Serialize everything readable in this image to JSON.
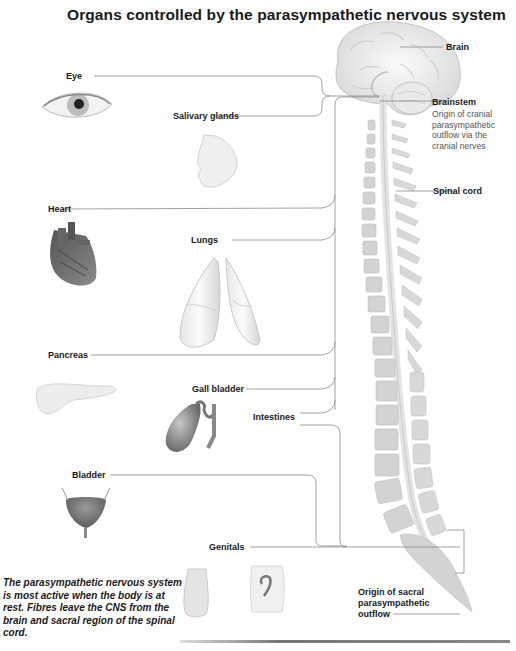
{
  "title": "Organs controlled by the parasympathetic nervous system",
  "labels": {
    "brain": "Brain",
    "brainstem": "Brainstem",
    "brainstem_desc": [
      "Origin of cranial",
      "parasympathetic",
      "outflow via the",
      "cranial nerves"
    ],
    "spinal_cord": "Spinal cord",
    "eye": "Eye",
    "salivary_glands": "Salivary glands",
    "heart": "Heart",
    "lungs": "Lungs",
    "pancreas": "Pancreas",
    "gall_bladder": "Gall bladder",
    "intestines": "Intestines",
    "bladder": "Bladder",
    "genitals": "Genitals",
    "sacral_origin": [
      "Origin of sacral",
      "parasympathetic",
      "outflow"
    ]
  },
  "note": "The parasympathetic nervous system is most active when the body is at rest. Fibres leave the CNS from the brain and sacral region of the spinal cord.",
  "colors": {
    "text": "#1a1a1a",
    "leader_line": "#8a8a8a",
    "bone": "#cfcfcf",
    "organ_shade": "#9a9a9a"
  }
}
